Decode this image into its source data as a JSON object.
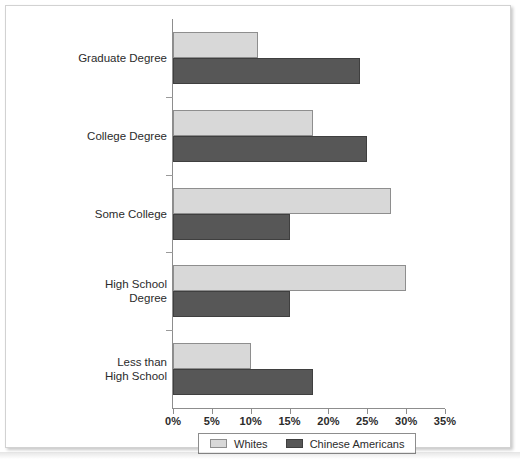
{
  "figure": {
    "legend": {
      "entries": [
        {
          "label": "Whites",
          "swatch": "light-gray-swatch",
          "color": "#d8d8d8"
        },
        {
          "label": "Chinese Americans",
          "swatch": "dark-gray-swatch",
          "color": "#575757"
        }
      ]
    }
  },
  "chart_data": {
    "type": "bar",
    "orientation": "horizontal",
    "title": "",
    "xlabel": "",
    "ylabel": "",
    "xlim": [
      0,
      35
    ],
    "xticks": [
      0,
      5,
      10,
      15,
      20,
      25,
      30,
      35
    ],
    "xtick_labels": [
      "0%",
      "5%",
      "10%",
      "15%",
      "20%",
      "25%",
      "30%",
      "35%"
    ],
    "grid": false,
    "legend_position": "bottom",
    "categories": [
      "Graduate Degree",
      "College Degree",
      "Some College",
      "High School\nDegree",
      "Less than\nHigh School"
    ],
    "series": [
      {
        "name": "Whites",
        "color": "#d8d8d8",
        "values": [
          11,
          18,
          28,
          30,
          10
        ]
      },
      {
        "name": "Chinese Americans",
        "color": "#575757",
        "values": [
          24,
          25,
          15,
          15,
          18
        ]
      }
    ]
  }
}
